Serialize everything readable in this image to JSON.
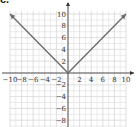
{
  "panel_label": "c.",
  "chart_data": {
    "type": "line",
    "title": "",
    "function": "y = |x|",
    "xlabel": "x",
    "ylabel": "y",
    "xlim": [
      -10,
      10
    ],
    "ylim": [
      -8,
      10
    ],
    "grid": true,
    "x_ticks": [
      -10,
      -8,
      -6,
      -4,
      -2,
      2,
      4,
      6,
      8,
      10
    ],
    "y_ticks": [
      -8,
      -6,
      -4,
      -2,
      2,
      4,
      6,
      8,
      10
    ],
    "x_tick_labels": [
      "−10",
      "−8",
      "−6",
      "−4",
      "−2",
      "2",
      "4",
      "6",
      "8",
      "10"
    ],
    "y_tick_labels": [
      "−8",
      "−6",
      "−4",
      "−2",
      "2",
      "4",
      "6",
      "8",
      "10"
    ],
    "series": [
      {
        "name": "y = |x|",
        "x": [
          -10,
          0,
          10
        ],
        "y": [
          10,
          0,
          10
        ],
        "arrows": "both-ends"
      }
    ],
    "colors": {
      "grid": "#d8d8d8",
      "axis": "#333333",
      "line": "#6a6a6a",
      "text": "#333333"
    }
  }
}
